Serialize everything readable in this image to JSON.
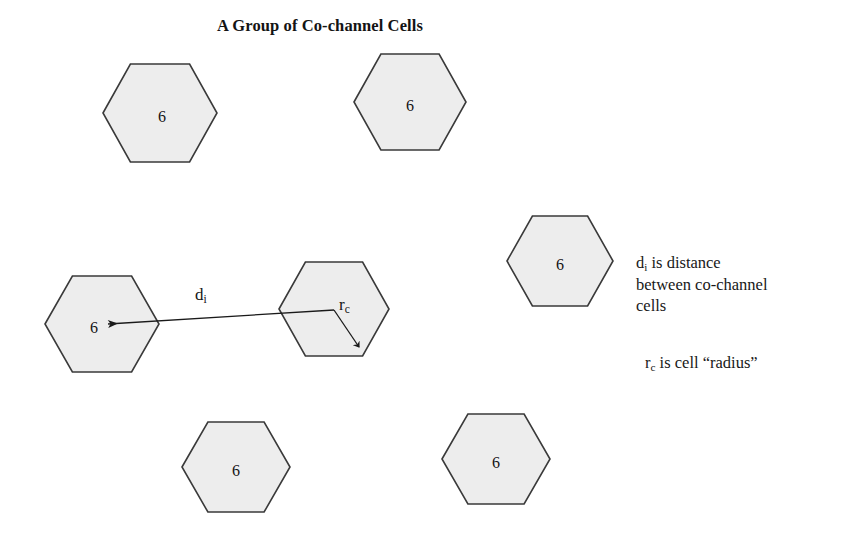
{
  "title": "A Group of Co-channel Cells",
  "colors": {
    "background": "#ffffff",
    "hex_fill": "#ededed",
    "hex_stroke": "#3a3a3a",
    "line": "#1a1a1a",
    "text": "#141414"
  },
  "cells": [
    {
      "name": "cell-top-left",
      "label": "6",
      "cx": 160,
      "cy": 113,
      "rx": 57,
      "ry": 49,
      "label_dx": 2,
      "label_dy": 9
    },
    {
      "name": "cell-top-center",
      "label": "6",
      "cx": 410,
      "cy": 102,
      "rx": 56,
      "ry": 48,
      "label_dx": 0,
      "label_dy": 9
    },
    {
      "name": "cell-right",
      "label": "6",
      "cx": 560,
      "cy": 261,
      "rx": 53,
      "ry": 45,
      "label_dx": 0,
      "label_dy": 9
    },
    {
      "name": "cell-center",
      "label": "",
      "cx": 334,
      "cy": 309,
      "rx": 55,
      "ry": 47,
      "label_dx": 0,
      "label_dy": 0
    },
    {
      "name": "cell-left",
      "label": "6",
      "cx": 102,
      "cy": 324,
      "rx": 57,
      "ry": 48,
      "label_dx": -8,
      "label_dy": 9
    },
    {
      "name": "cell-bottom-left",
      "label": "6",
      "cx": 236,
      "cy": 467,
      "rx": 54,
      "ry": 45,
      "label_dx": 0,
      "label_dy": 9
    },
    {
      "name": "cell-bottom-right",
      "label": "6",
      "cx": 496,
      "cy": 459,
      "rx": 54,
      "ry": 45,
      "label_dx": 0,
      "label_dy": 9
    }
  ],
  "annotations": {
    "distance_arrow": {
      "name": "distance-arrow",
      "from_x": 334,
      "from_y": 310,
      "to_x": 108,
      "to_y": 324
    },
    "radius_line": {
      "name": "radius-line",
      "from_x": 334,
      "from_y": 310,
      "to_x": 359,
      "to_y": 347
    },
    "distance_label": {
      "base": "d",
      "sub": "i"
    },
    "radius_label": {
      "base": "r",
      "sub": "c"
    }
  },
  "legend": {
    "paragraph1": {
      "line1_base": "d",
      "line1_sub": "i",
      "line1_rest": " is distance",
      "line2": "between co-channel",
      "line3": "cells"
    },
    "paragraph2": {
      "base": "r",
      "sub": "c",
      "rest": " is cell “radius”"
    }
  }
}
